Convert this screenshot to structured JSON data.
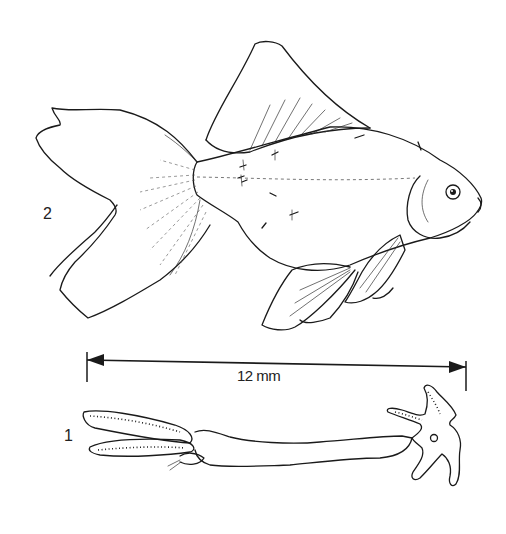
{
  "figure": {
    "labels": {
      "fish": "2",
      "parasite": "1"
    },
    "scale_bar": {
      "text": "12 mm",
      "x_start": 87,
      "x_end": 466
    },
    "colors": {
      "ink": "#1a1a1a",
      "background": "#ffffff"
    }
  }
}
